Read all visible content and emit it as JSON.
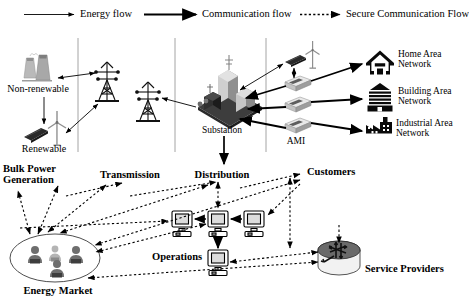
{
  "diagram": {
    "type": "architecture-diagram"
  },
  "legend": {
    "items": [
      {
        "label": "Energy flow",
        "style": "solid-thin",
        "icon": "arrow-right-icon",
        "color": "#000000"
      },
      {
        "label": "Communication flow",
        "style": "solid-thick",
        "icon": "arrow-right-icon",
        "color": "#000000"
      },
      {
        "label": "Secure Communication Flow",
        "style": "dotted",
        "icon": "arrow-right-dotted-icon",
        "color": "#000000"
      }
    ]
  },
  "physical_layer": {
    "nodes": [
      {
        "id": "non-renewable",
        "label": "Non-renewable",
        "icon": "cooling-towers-icon"
      },
      {
        "id": "renewable",
        "label": "Renewable",
        "icon": "solar-panel-wind-turbine-icon"
      },
      {
        "id": "tower-1",
        "label": "",
        "icon": "transmission-tower-icon"
      },
      {
        "id": "tower-2",
        "label": "",
        "icon": "transmission-tower-icon"
      },
      {
        "id": "substation",
        "label": "Substation",
        "icon": "substation-icon"
      },
      {
        "id": "ami",
        "label": "AMI",
        "icon": "smart-meter-icon"
      },
      {
        "id": "der",
        "label": "",
        "icon": "solar-panel-wind-turbine-icon"
      },
      {
        "id": "home-area-network",
        "label": "Home Area\nNetwork",
        "line1": "Home Area",
        "line2": "Network",
        "icon": "house-icon"
      },
      {
        "id": "building-area-network",
        "label": "Building Area\nNetwork",
        "line1": "Building Area",
        "line2": "Network",
        "icon": "building-icon"
      },
      {
        "id": "industrial-area-network",
        "label": "Industrial Area\nNetwork",
        "line1": "Industrial Area",
        "line2": "Network",
        "icon": "factory-icon"
      }
    ]
  },
  "domain_layer": {
    "nodes": [
      {
        "id": "bulk-power-generation",
        "line1": "Bulk Power",
        "line2": "Generation"
      },
      {
        "id": "transmission",
        "label": "Transmission"
      },
      {
        "id": "distribution",
        "label": "Distribution"
      },
      {
        "id": "customers",
        "label": "Customers"
      },
      {
        "id": "operations",
        "label": "Operations",
        "icon": "computer-icon"
      },
      {
        "id": "energy-market",
        "label": "Energy Market",
        "icon": "people-group-icon"
      },
      {
        "id": "service-providers",
        "label": "Service Providers",
        "icon": "router-icon"
      }
    ]
  },
  "colors": {
    "stroke": "#000000",
    "gray_divider": "#808080",
    "renewable_gray": "#9a9a9a",
    "substation_gray": "#6e6e6e",
    "background": "#ffffff"
  }
}
